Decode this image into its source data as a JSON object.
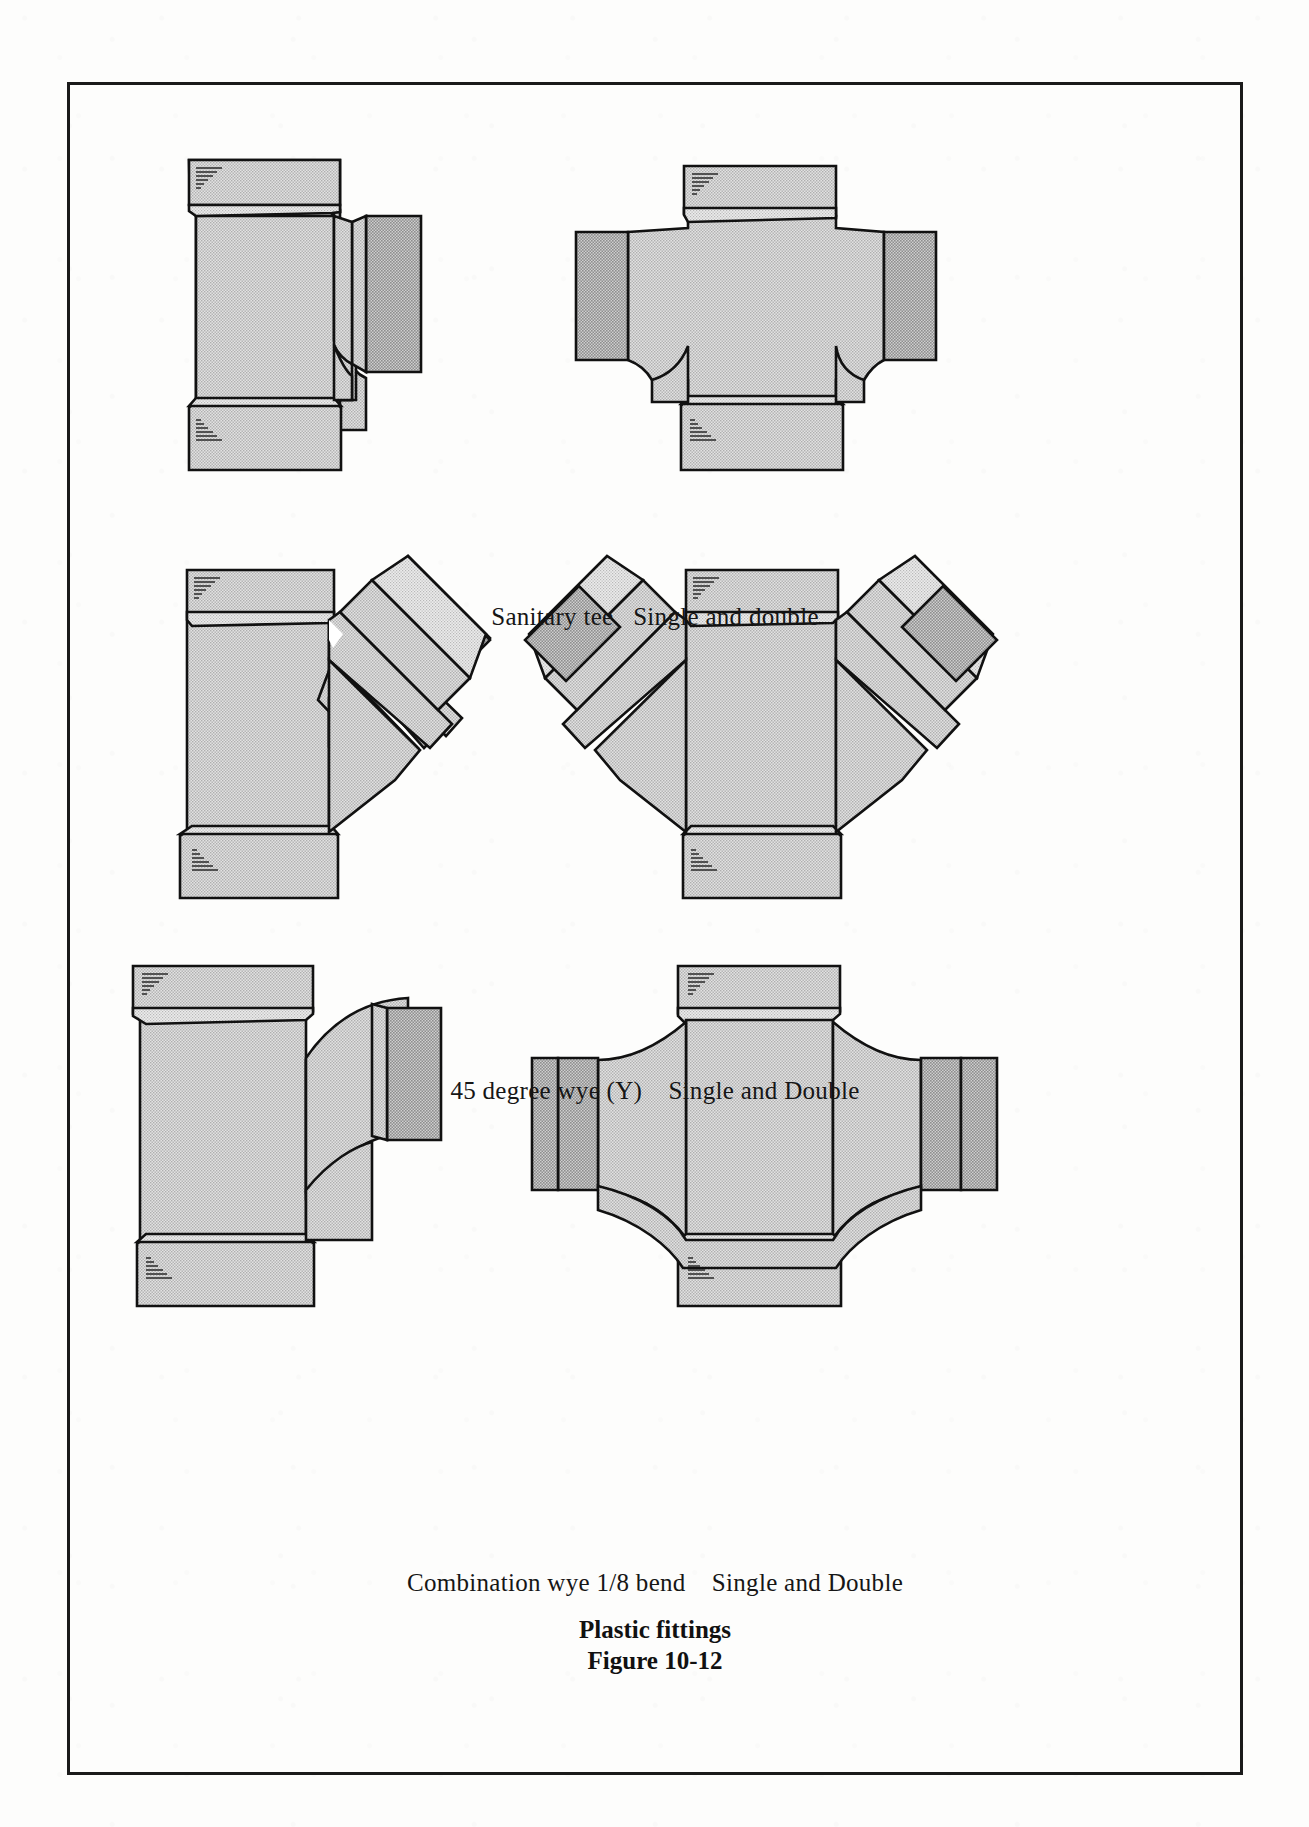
{
  "figure": {
    "title": "Plastic fittings",
    "number": "Figure 10-12",
    "frame_color": "#1a1a1a",
    "page_background": "#fdfdfc"
  },
  "style": {
    "fitting_fill": "#d2d2d2",
    "fitting_fill_dark": "#bdbdbd",
    "fitting_fill_light": "#dcdcdc",
    "outline_color": "#111111",
    "hatch_color": "#2a2a2a"
  },
  "rows": [
    {
      "id": "sanitary-tee",
      "caption": "Sanitary tee   Single and double",
      "caption_parts": {
        "name": "Sanitary tee",
        "variants": "Single and double"
      },
      "fittings": [
        {
          "id": "sanitary-tee-single",
          "variant": "Single",
          "hubs": 3
        },
        {
          "id": "sanitary-tee-double",
          "variant": "Double",
          "hubs": 4
        }
      ]
    },
    {
      "id": "wye-45",
      "caption": "45 degree wye (Y)    Single and Double",
      "caption_parts": {
        "name": "45 degree wye (Y)",
        "variants": "Single and Double"
      },
      "fittings": [
        {
          "id": "wye-45-single",
          "variant": "Single",
          "hubs": 3
        },
        {
          "id": "wye-45-double",
          "variant": "Double",
          "hubs": 4
        }
      ]
    },
    {
      "id": "combination-wye-eighth-bend",
      "caption": "Combination wye 1/8 bend    Single and Double",
      "caption_parts": {
        "name": "Combination wye 1/8 bend",
        "variants": "Single and Double"
      },
      "fittings": [
        {
          "id": "combination-wye-single",
          "variant": "Single",
          "hubs": 3
        },
        {
          "id": "combination-wye-double",
          "variant": "Double",
          "hubs": 4
        }
      ]
    }
  ]
}
